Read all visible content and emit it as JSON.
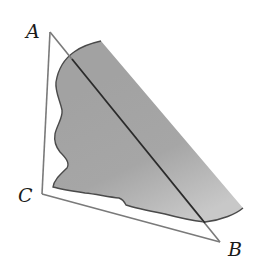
{
  "figure": {
    "type": "geometry-diagram",
    "canvas": {
      "width": 256,
      "height": 270
    },
    "colors": {
      "background": "#ffffff",
      "triangle_stroke": "#7a7a7a",
      "ab_stroke": "#2a2a2a",
      "region_fill_dark": "#9c9c9c",
      "region_fill_light": "#cfcfcf",
      "region_outline": "#4a4a4a",
      "label_color": "#1a1a1a"
    },
    "vertices": [
      {
        "name": "A",
        "label": "A",
        "x": 50,
        "y": 32,
        "label_x": 26,
        "label_y": 38
      },
      {
        "name": "B",
        "label": "B",
        "x": 220,
        "y": 242,
        "label_x": 228,
        "label_y": 256
      },
      {
        "name": "C",
        "label": "C",
        "x": 42,
        "y": 194,
        "label_x": 18,
        "label_y": 202
      }
    ],
    "sides": [
      {
        "from": "A",
        "to": "C"
      },
      {
        "from": "C",
        "to": "B"
      },
      {
        "from": "A",
        "to": "B"
      }
    ],
    "region": {
      "label": "",
      "description": "irregular shaded region bounded on the right by a straight edge"
    }
  }
}
